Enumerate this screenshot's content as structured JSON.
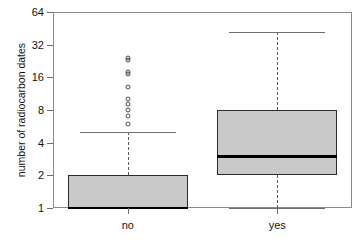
{
  "chart_data": {
    "type": "box",
    "title": "",
    "xlabel": "",
    "ylabel": "number of radiocarbon dates",
    "yscale": "log2",
    "ylim": [
      1,
      64
    ],
    "yticks": [
      1,
      2,
      4,
      8,
      16,
      32,
      64
    ],
    "ytick_labels": [
      "1",
      "2",
      "4",
      "8",
      "16",
      "32",
      "64"
    ],
    "categories": [
      "no",
      "yes"
    ],
    "grid": false,
    "legend": "none",
    "boxes": [
      {
        "category": "no",
        "whisker_low": 1,
        "q1": 1,
        "median": 1,
        "q3": 2,
        "whisker_high": 5,
        "outliers": [
          6,
          7,
          8,
          9,
          10,
          13,
          17,
          18,
          23,
          24
        ]
      },
      {
        "category": "yes",
        "whisker_low": 1,
        "q1": 2,
        "median": 3,
        "q3": 8,
        "whisker_high": 42,
        "outliers": []
      }
    ]
  },
  "style": {
    "box_fill": "#c9c9c9",
    "box_border": "#2b2b2b",
    "median_color": "#000000",
    "whisker_color": "#5a5a5a",
    "frame_color": "#8a8a8a",
    "text_color": "#111111"
  }
}
